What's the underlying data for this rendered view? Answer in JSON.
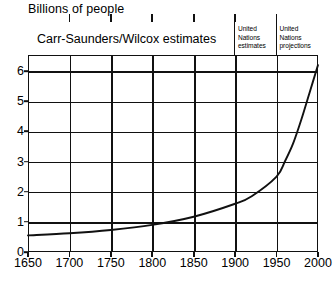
{
  "chart_title": "Billions of people",
  "bands": [
    {
      "id": "carr-saunders",
      "label": "Carr-Saunders/Wilcox estimates",
      "from": 1650,
      "to": 1900
    },
    {
      "id": "un-estimates",
      "line1": "United",
      "line2": "Nations",
      "line3": "estimates",
      "from": 1900,
      "to": 1950
    },
    {
      "id": "un-projections",
      "line1": "United",
      "line2": "Nations",
      "line3": "projections",
      "from": 1950,
      "to": 2000
    }
  ],
  "axes": {
    "y_ticks": [
      "6",
      "5",
      "4",
      "3",
      "2",
      "1",
      "0"
    ],
    "x_ticks": [
      "1650",
      "1700",
      "1750",
      "1800",
      "1850",
      "1900",
      "1950",
      "2000"
    ]
  },
  "colors": {
    "line": "#111111",
    "grid": "#111111",
    "background": "#ffffff"
  },
  "chart_data": {
    "type": "line",
    "title": "Billions of people",
    "xlabel": "",
    "ylabel": "Billions of people",
    "xlim": [
      1650,
      2000
    ],
    "ylim": [
      0,
      6.5
    ],
    "grid": true,
    "legend": "none",
    "xticks": [
      1650,
      1700,
      1750,
      1800,
      1850,
      1900,
      1950,
      2000
    ],
    "yticks": [
      0,
      1,
      2,
      3,
      4,
      5,
      6
    ],
    "annotations": [
      "Carr-Saunders/Wilcox estimates (1650-1900)",
      "United Nations estimates (1900-1950)",
      "United Nations projections (1950-2000)"
    ],
    "series": [
      {
        "name": "World population",
        "x": [
          1650,
          1700,
          1750,
          1800,
          1850,
          1900,
          1920,
          1950,
          1960,
          1970,
          1980,
          1990,
          2000
        ],
        "values": [
          0.55,
          0.62,
          0.73,
          0.9,
          1.17,
          1.6,
          1.85,
          2.5,
          3.0,
          3.6,
          4.4,
          5.3,
          6.2
        ]
      }
    ]
  }
}
